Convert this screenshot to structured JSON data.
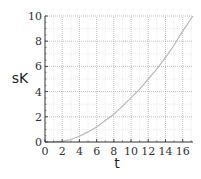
{
  "chart_data": {
    "type": "line",
    "title": "",
    "xlabel": "t",
    "ylabel": "sK",
    "xlim": [
      0,
      17.2
    ],
    "ylim": [
      0,
      10
    ],
    "grid": true,
    "legend": "none",
    "x_ticks": [
      0,
      2,
      4,
      6,
      8,
      10,
      12,
      14,
      16
    ],
    "y_ticks": [
      0,
      2,
      4,
      6,
      8,
      10
    ],
    "series": [
      {
        "name": "sK(t)",
        "color": "#b8b8b8",
        "x": [
          0,
          1,
          2,
          3,
          4,
          5,
          6,
          7,
          8,
          9,
          10,
          11,
          12,
          13,
          14,
          15,
          16,
          17,
          17.2
        ],
        "values": [
          0,
          0.01,
          0.05,
          0.2,
          0.45,
          0.8,
          1.2,
          1.7,
          2.2,
          2.85,
          3.5,
          4.2,
          5.0,
          5.8,
          6.7,
          7.7,
          8.8,
          9.8,
          10.0
        ]
      }
    ]
  },
  "colors": {
    "axis": "#333333",
    "major_grid": "#999999",
    "minor_grid": "#dddddd",
    "curve": "#b8b8b8"
  }
}
